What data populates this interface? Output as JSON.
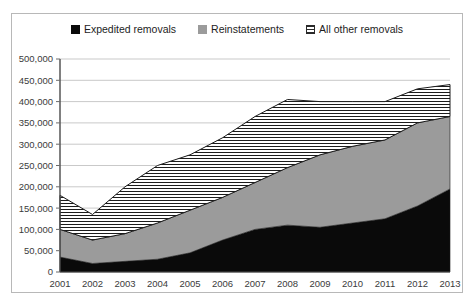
{
  "legend": {
    "position": "top-center",
    "items": [
      {
        "label": "Expedited removals",
        "swatch": "black-square-icon",
        "color": "#0a0a0a"
      },
      {
        "label": "Reinstatements",
        "swatch": "gray-square-icon",
        "color": "#9b9b9b"
      },
      {
        "label": "All other removals",
        "swatch": "hatched-square-icon",
        "color": "#ffffff"
      }
    ]
  },
  "axes": {
    "y_ticks": [
      "0",
      "50,000",
      "100,000",
      "150,000",
      "200,000",
      "250,000",
      "300,000",
      "350,000",
      "400,000",
      "450,000",
      "500,000"
    ],
    "x_ticks": [
      "2001",
      "2002",
      "2003",
      "2004",
      "2005",
      "2006",
      "2007",
      "2008",
      "2009",
      "2010",
      "2011",
      "2012",
      "2013"
    ]
  },
  "chart_data": {
    "type": "area",
    "stacked": true,
    "title": "",
    "subtitle": "",
    "xlabel": "",
    "ylabel": "",
    "ylim": [
      0,
      500000
    ],
    "ytick_interval": 50000,
    "grid": true,
    "legend_position": "top-center",
    "categories": [
      "2001",
      "2002",
      "2003",
      "2004",
      "2005",
      "2006",
      "2007",
      "2008",
      "2009",
      "2010",
      "2011",
      "2012",
      "2013"
    ],
    "series": [
      {
        "name": "Expedited removals",
        "color": "#0a0a0a",
        "fill": "solid",
        "values": [
          35000,
          20000,
          25000,
          30000,
          45000,
          75000,
          100000,
          110000,
          105000,
          115000,
          125000,
          155000,
          195000
        ]
      },
      {
        "name": "Reinstatements",
        "color": "#9b9b9b",
        "fill": "solid",
        "values": [
          65000,
          55000,
          65000,
          85000,
          100000,
          100000,
          110000,
          135000,
          170000,
          180000,
          185000,
          195000,
          170000
        ]
      },
      {
        "name": "All other removals",
        "color": "#ffffff",
        "fill": "horizontal-hatch",
        "values": [
          80000,
          60000,
          110000,
          135000,
          130000,
          140000,
          155000,
          160000,
          125000,
          105000,
          90000,
          80000,
          75000
        ]
      }
    ],
    "cumulative_totals": [
      180000,
      135000,
      200000,
      250000,
      275000,
      315000,
      365000,
      405000,
      400000,
      400000,
      400000,
      430000,
      440000
    ]
  }
}
